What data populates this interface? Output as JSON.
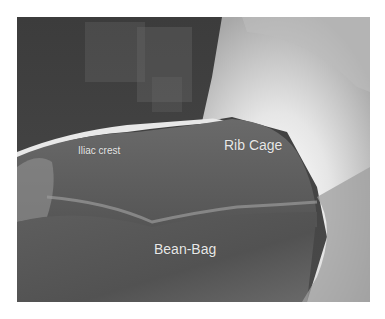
{
  "figure": {
    "type": "grayscale clinical photograph",
    "labels": {
      "iliac_crest": "Iliac crest",
      "rib_cage": "Rib Cage",
      "bean_bag": "Bean-Bag"
    },
    "colors": {
      "background": "#ffffff",
      "label_text": "#e8e8e8",
      "dark_background": "#3a3a3a",
      "body_drape": "#5a5a5a",
      "highlight": "#f4f4f4"
    }
  }
}
